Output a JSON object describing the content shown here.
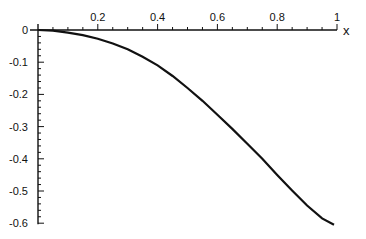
{
  "chart_data": {
    "type": "line",
    "title": "",
    "xlabel": "x",
    "ylabel": "",
    "xlim": [
      0,
      1
    ],
    "ylim": [
      -0.6,
      0
    ],
    "grid": false,
    "legend": null,
    "x_ticks": [
      "0.2",
      "0.4",
      "0.6",
      "0.8",
      "1"
    ],
    "y_ticks": [
      "0",
      "-0.1",
      "-0.2",
      "-0.3",
      "-0.4",
      "-0.5",
      "-0.6"
    ],
    "series": [
      {
        "name": "curve",
        "color": "#111111",
        "x": [
          0,
          0.05,
          0.1,
          0.15,
          0.2,
          0.25,
          0.3,
          0.35,
          0.4,
          0.45,
          0.5,
          0.55,
          0.6,
          0.65,
          0.7,
          0.75,
          0.8,
          0.85,
          0.9,
          0.95,
          0.99
        ],
        "y": [
          0,
          -0.002,
          -0.008,
          -0.016,
          -0.027,
          -0.042,
          -0.06,
          -0.083,
          -0.11,
          -0.143,
          -0.18,
          -0.22,
          -0.263,
          -0.307,
          -0.353,
          -0.4,
          -0.45,
          -0.498,
          -0.545,
          -0.585,
          -0.605
        ]
      }
    ]
  }
}
